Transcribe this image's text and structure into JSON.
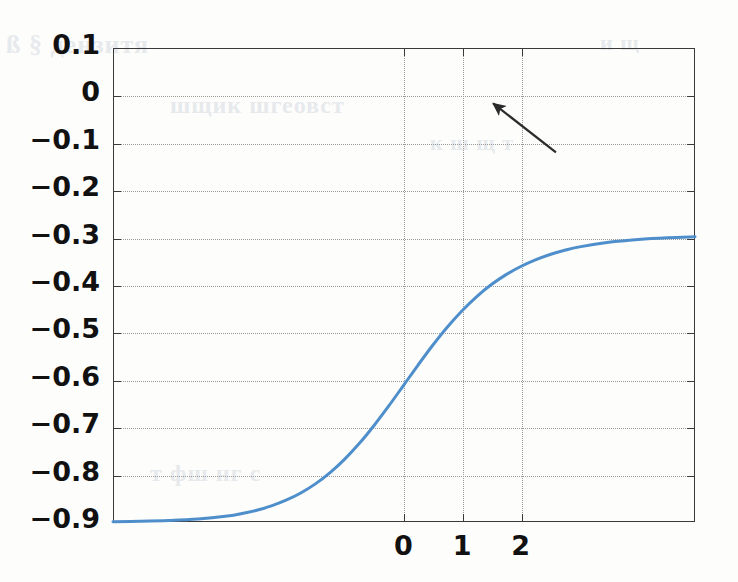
{
  "chart_data": {
    "type": "line",
    "title": "",
    "subtitle": "",
    "xlabel": "",
    "ylabel": "",
    "xlim": [
      -4.95,
      4.97
    ],
    "ylim": [
      -0.9,
      0.1
    ],
    "grid": true,
    "legend": null,
    "x_ticks": [
      0,
      1,
      2
    ],
    "x_tick_labels": [
      "0",
      "1",
      "2"
    ],
    "y_ticks": [
      0.1,
      0,
      -0.1,
      -0.2,
      -0.3,
      -0.4,
      -0.5,
      -0.6,
      -0.7,
      -0.8,
      -0.9
    ],
    "y_tick_labels": [
      "0.1",
      "0",
      "−0.1",
      "−0.2",
      "−0.3",
      "−0.4",
      "−0.5",
      "−0.6",
      "−0.7",
      "−0.8",
      "−0.9"
    ],
    "series": [
      {
        "name": "sigmoid",
        "color": "#4e8fcb",
        "line_width": 3,
        "description": "logistic curve y = -0.9 + 1.0/(1+exp(-1.45 x)), saturating at -0.9 on the left and 0.1 on the right, passing through (0, -0.4)",
        "x": [
          -4.95,
          -4.5,
          -4.0,
          -3.5,
          -3.0,
          -2.75,
          -2.5,
          -2.25,
          -2.0,
          -1.75,
          -1.5,
          -1.25,
          -1.0,
          -0.75,
          -0.5,
          -0.25,
          0.0,
          0.25,
          0.5,
          0.75,
          1.0,
          1.25,
          1.5,
          1.75,
          2.0,
          2.25,
          2.5,
          2.75,
          3.0,
          3.5,
          4.0,
          4.5,
          4.97
        ],
        "y": [
          -0.8993,
          -0.8986,
          -0.897,
          -0.8939,
          -0.8875,
          -0.8822,
          -0.8752,
          -0.866,
          -0.8541,
          -0.8388,
          -0.8196,
          -0.7958,
          -0.7673,
          -0.734,
          -0.6963,
          -0.6552,
          -0.6121,
          -0.5688,
          -0.5271,
          -0.4886,
          -0.4542,
          -0.4243,
          -0.3991,
          -0.3781,
          -0.3609,
          -0.3469,
          -0.3357,
          -0.3267,
          -0.3196,
          -0.3099,
          -0.3039,
          -0.3002,
          -0.2983
        ]
      }
    ],
    "annotations": [
      {
        "type": "arrow",
        "label": "",
        "tail_data": [
          2.6,
          -0.12
        ],
        "head_data": [
          1.53,
          -0.017
        ],
        "color": "#2b2b2b"
      }
    ]
  },
  "figure": {
    "background_color": "#ffffff",
    "axes_color": "#3a3a3a",
    "grid_color": "#9a9a9a",
    "curve_color": "#4e8fcb"
  },
  "ghost_text": {
    "line1": "ß § дензитя",
    "line2": "шщик шгеовст",
    "line3": "т фш нг с",
    "line4": "к ш щ т",
    "line5": "и щ"
  }
}
